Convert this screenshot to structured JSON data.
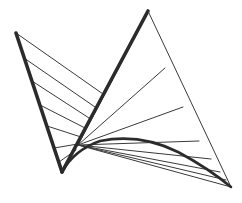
{
  "figure": {
    "type": "line-drawing",
    "canvas": {
      "width": 242,
      "height": 203
    },
    "colors": {
      "background": "#ffffff",
      "thick_stroke": "#2b2b2b",
      "thin_stroke": "#3a3a3a"
    },
    "stroke_widths": {
      "thick": 3.6,
      "thin": 1.0
    },
    "vertices": {
      "left_top": {
        "x": 16,
        "y": 33,
        "label": "A"
      },
      "left_bottom": {
        "x": 62,
        "y": 172,
        "label": "B"
      },
      "apex": {
        "x": 148,
        "y": 11,
        "label": "C"
      },
      "right_bottom": {
        "x": 231,
        "y": 187,
        "label": "D"
      },
      "fan_origin": {
        "x": 78,
        "y": 145,
        "label": "O"
      }
    },
    "outline_paths": [
      {
        "name": "left-limb-outer",
        "from": "left_top",
        "to": "left_bottom",
        "weight": "thick"
      },
      {
        "name": "left-limb-inner",
        "from": "left_bottom",
        "to": "apex",
        "weight": "thick"
      },
      {
        "name": "right-limb-outer",
        "from": "apex",
        "to": "right_bottom",
        "weight": "thin"
      }
    ],
    "left_fan": {
      "name": "left-fan",
      "count": 7,
      "origin_edge": {
        "from": "left_top",
        "to": "left_bottom"
      },
      "target_edge": {
        "from": "left_bottom",
        "to": "apex"
      },
      "lines": [
        {
          "x1": 16,
          "y1": 33,
          "x2": 103,
          "y2": 94
        },
        {
          "x1": 24,
          "y1": 58,
          "x2": 95,
          "y2": 107
        },
        {
          "x1": 32,
          "y1": 81,
          "x2": 89,
          "y2": 118
        },
        {
          "x1": 40,
          "y1": 105,
          "x2": 85,
          "y2": 128
        },
        {
          "x1": 47,
          "y1": 126,
          "x2": 81,
          "y2": 137
        },
        {
          "x1": 54,
          "y1": 148,
          "x2": 78,
          "y2": 144
        },
        {
          "x1": 59,
          "y1": 162,
          "x2": 76,
          "y2": 150
        }
      ]
    },
    "right_fan": {
      "name": "right-fan",
      "count": 8,
      "origin": "fan_origin",
      "target_edge": {
        "from": "apex",
        "to": "right_bottom"
      },
      "lines": [
        {
          "x1": 78,
          "y1": 145,
          "x2": 148,
          "y2": 12
        },
        {
          "x1": 78,
          "y1": 145,
          "x2": 165,
          "y2": 68
        },
        {
          "x1": 78,
          "y1": 145,
          "x2": 183,
          "y2": 107
        },
        {
          "x1": 78,
          "y1": 145,
          "x2": 199,
          "y2": 141
        },
        {
          "x1": 78,
          "y1": 145,
          "x2": 211,
          "y2": 159
        },
        {
          "x1": 78,
          "y1": 145,
          "x2": 220,
          "y2": 172
        },
        {
          "x1": 78,
          "y1": 145,
          "x2": 226,
          "y2": 180
        },
        {
          "x1": 78,
          "y1": 145,
          "x2": 231,
          "y2": 187
        }
      ]
    },
    "envelope_curve": {
      "name": "envelope-curve",
      "weight": "thick",
      "description": "Tangent envelope arc sweeping from the left bottom vertex to the right bottom vertex",
      "path": "M 62 172 Q 74 150 100 141 Q 140 133 178 152 Q 208 168 231 187"
    }
  }
}
